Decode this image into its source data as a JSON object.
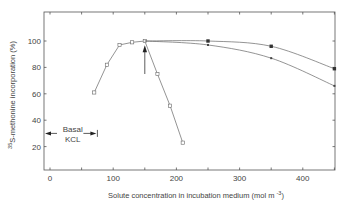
{
  "chart_data": {
    "type": "line",
    "title": "",
    "xlabel": "Solute concentration in incubation medium (mol m",
    "xlabel_superscript": "-3",
    "xlabel_suffix": ")",
    "ylabel_superscript": "35",
    "ylabel": "S-methonine incorporation (%)",
    "xlim": [
      -8,
      458
    ],
    "ylim": [
      2,
      122
    ],
    "x_ticks": [
      0,
      100,
      200,
      300,
      400
    ],
    "x_minor_ticks": [
      50,
      150,
      250,
      350,
      450
    ],
    "y_ticks": [
      20,
      40,
      60,
      80,
      100
    ],
    "grid": false,
    "legend": null,
    "series": [
      {
        "name": "Open squares (decline after 150)",
        "marker": "open-square",
        "x": [
          70,
          90,
          110,
          130,
          150,
          170,
          190,
          210
        ],
        "y": [
          61,
          82,
          97,
          99,
          100,
          75,
          51,
          23
        ]
      },
      {
        "name": "Filled squares (upper curve)",
        "marker": "filled-square",
        "x": [
          150,
          250,
          350,
          450
        ],
        "y": [
          100,
          100,
          96,
          79
        ]
      },
      {
        "name": "Small filled points (lower curve)",
        "marker": "small-filled-square",
        "x": [
          150,
          250,
          350,
          450
        ],
        "y": [
          100,
          97,
          87,
          66
        ]
      }
    ],
    "annotations": [
      {
        "type": "arrow-up",
        "x": 150,
        "y_from": 75,
        "y_to": 96,
        "label": ""
      },
      {
        "type": "range-arrows",
        "x_from": 0,
        "x_to": 75,
        "y": 30,
        "label_line1": "Basal",
        "label_line2": "KCL"
      }
    ]
  }
}
